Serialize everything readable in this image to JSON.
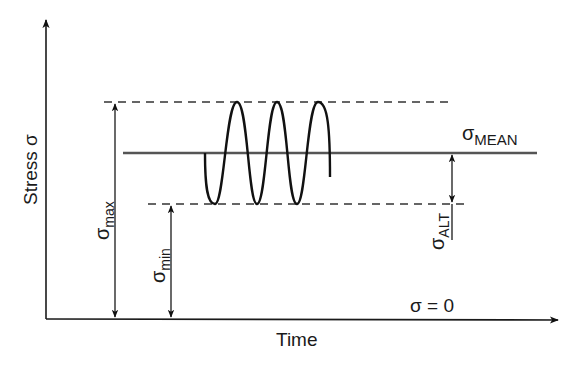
{
  "diagram": {
    "y_axis": {
      "label": "Stress σ"
    },
    "x_axis": {
      "label": "Time",
      "baseline_label": "σ = 0"
    },
    "levels": {
      "max": {
        "symbol": "σ",
        "subscript": "max"
      },
      "min": {
        "symbol": "σ",
        "subscript": "min"
      },
      "mean": {
        "symbol": "σ",
        "subscript": "MEAN"
      },
      "alt": {
        "symbol": "σ",
        "subscript": "ALT"
      }
    },
    "waveform": {
      "type": "sinusoidal",
      "cycles_visible": 3.5
    },
    "colors": {
      "ink": "#1a1a1a",
      "mean_line": "#555555",
      "background": "#ffffff"
    }
  }
}
